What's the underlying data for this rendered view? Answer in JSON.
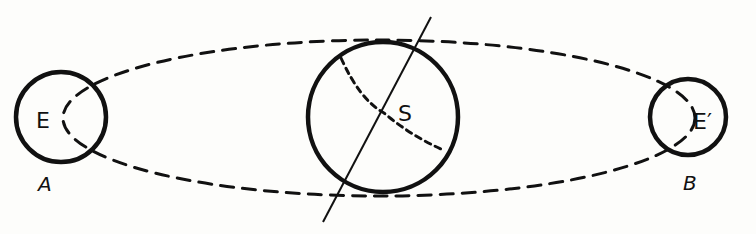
{
  "diagram": {
    "background": "#fdfdfb",
    "stroke_color": "#111111",
    "labels": {
      "earth_a": "E",
      "earth_b": "E′",
      "sun": "S",
      "position_a": "A",
      "position_b": "B"
    },
    "elements": [
      {
        "id": "orbit",
        "type": "dashed-ellipse",
        "description": "Earth's orbit"
      },
      {
        "id": "sun",
        "type": "circle",
        "label": "S"
      },
      {
        "id": "sun-axis",
        "type": "line",
        "description": "tilted rotation axis of the Sun"
      },
      {
        "id": "sun-equator",
        "type": "dashed-arc",
        "description": "dashed curve across the Sun"
      },
      {
        "id": "earth-a",
        "type": "circle",
        "label": "E",
        "position": "A"
      },
      {
        "id": "earth-b",
        "type": "circle",
        "label": "E′",
        "position": "B"
      }
    ]
  }
}
